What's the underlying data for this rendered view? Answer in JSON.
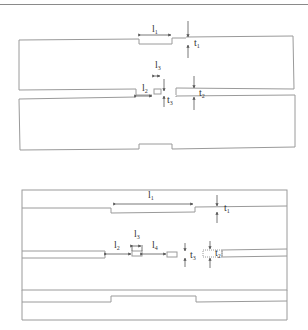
{
  "figure": {
    "type": "two-panel dimensioned schematic",
    "line_color": "#9a9a9a",
    "dimension_color": "#555555"
  },
  "panel_top": {
    "labels": {
      "l1": {
        "base": "l",
        "sub": "1"
      },
      "t1": {
        "base": "t",
        "sub": "1"
      },
      "l2": {
        "base": "l",
        "sub": "2"
      },
      "l3": {
        "base": "l",
        "sub": "3"
      },
      "t2": {
        "base": "t",
        "sub": "2"
      },
      "t3": {
        "base": "t",
        "sub": "3"
      }
    }
  },
  "panel_bottom": {
    "labels": {
      "l1": {
        "base": "l",
        "sub": "1"
      },
      "t1": {
        "base": "t",
        "sub": "1"
      },
      "l2": {
        "base": "l",
        "sub": "2"
      },
      "l3": {
        "base": "l",
        "sub": "3"
      },
      "l4": {
        "base": "l",
        "sub": "4"
      },
      "t2": {
        "base": "t",
        "sub": "2"
      },
      "t3": {
        "base": "t",
        "sub": "3"
      }
    }
  }
}
